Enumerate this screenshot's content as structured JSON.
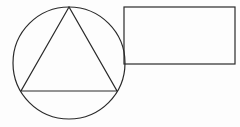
{
  "diagram": {
    "background": "#fdfdfd",
    "stroke_color": "#2a2a2a",
    "circle": {
      "cx": 69,
      "cy": 63,
      "r": 56
    },
    "triangle": {
      "points": [
        [
          69,
          7
        ],
        [
          21,
          91
        ],
        [
          117,
          91
        ]
      ]
    },
    "rectangle": {
      "x": 124,
      "y": 7,
      "width": 111,
      "height": 57
    }
  }
}
